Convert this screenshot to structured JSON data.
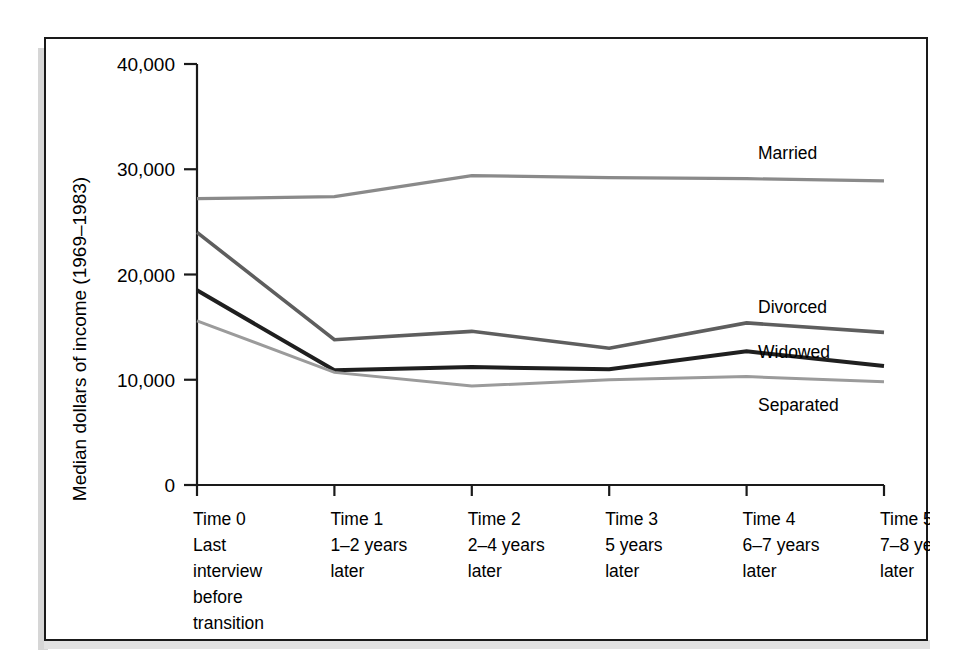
{
  "figure": {
    "frame_color": "#1a1a1a",
    "background_color": "#ffffff",
    "shadow_color": "#d6d6d6"
  },
  "chart_data": {
    "type": "line",
    "title": "",
    "xlabel": "",
    "ylabel": "Median dollars of income (1969–1983)",
    "ylim": [
      0,
      40000
    ],
    "yticks": [
      0,
      10000,
      20000,
      30000,
      40000
    ],
    "ytick_labels": [
      "0",
      "10,000",
      "20,000",
      "30,000",
      "40,000"
    ],
    "grid": false,
    "legend_position": "right-inline-labels",
    "categories": [
      "Time 0",
      "Time 1",
      "Time 2",
      "Time 3",
      "Time 4",
      "Time 5"
    ],
    "xtick_labels": [
      {
        "line1": "Time 0",
        "line2": "Last",
        "line3": "interview",
        "line4": "before",
        "line5": "transition"
      },
      {
        "line1": "Time 1",
        "line2": "1–2 years",
        "line3": "later",
        "line4": "",
        "line5": ""
      },
      {
        "line1": "Time 2",
        "line2": "2–4 years",
        "line3": "later",
        "line4": "",
        "line5": ""
      },
      {
        "line1": "Time 3",
        "line2": "5 years",
        "line3": "later",
        "line4": "",
        "line5": ""
      },
      {
        "line1": "Time 4",
        "line2": "6–7 years",
        "line3": "later",
        "line4": "",
        "line5": ""
      },
      {
        "line1": "Time 5",
        "line2": "7–8 years",
        "line3": "later",
        "line4": "",
        "line5": ""
      }
    ],
    "series": [
      {
        "name": "Married",
        "color": "#8a8a8a",
        "width": 3.2,
        "label_y_value": 31500,
        "values": [
          27200,
          27400,
          29400,
          29200,
          29100,
          28900
        ]
      },
      {
        "name": "Divorced",
        "color": "#5e5e5e",
        "width": 3.6,
        "label_y_value": 16900,
        "values": [
          24000,
          13800,
          14600,
          13000,
          15400,
          14500
        ]
      },
      {
        "name": "Widowed",
        "color": "#1f1f1f",
        "width": 4.0,
        "label_y_value": 12600,
        "values": [
          18500,
          10900,
          11200,
          11000,
          12700,
          11300
        ]
      },
      {
        "name": "Separated",
        "color": "#9b9b9b",
        "width": 3.0,
        "label_y_value": 7600,
        "values": [
          15600,
          10700,
          9400,
          10000,
          10300,
          9800
        ]
      }
    ]
  }
}
